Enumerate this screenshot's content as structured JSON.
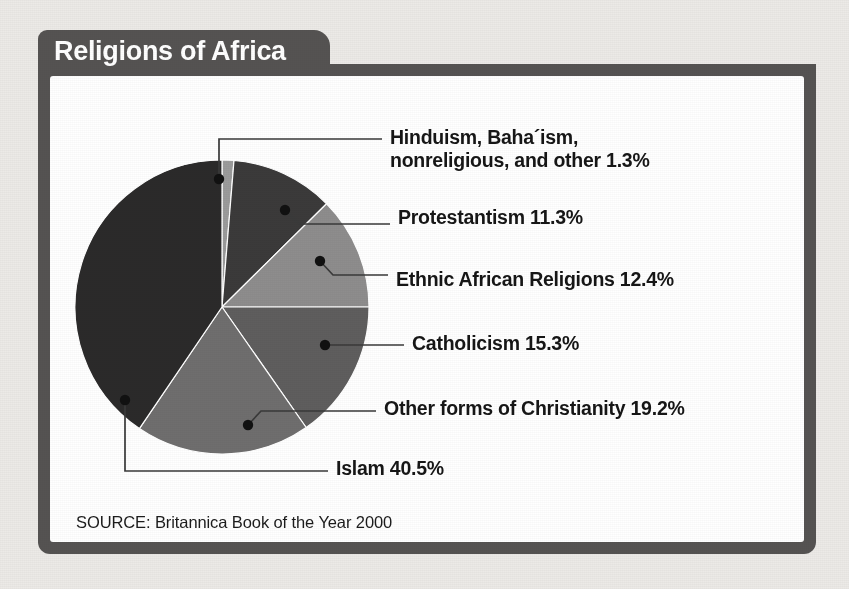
{
  "card": {
    "title": "Religions of Africa",
    "source": "SOURCE: Britannica Book of the Year 2000"
  },
  "colors": {
    "frame": "#555352",
    "title_text": "#ffffff",
    "card_background": "#ffffff",
    "page_background": "#eceae7",
    "label_text": "#161616",
    "leader_line": "#3a3a3a"
  },
  "chart_data": {
    "type": "pie",
    "title": "Religions of Africa",
    "subtitle": "",
    "xlabel": "",
    "ylabel": "",
    "source": "SOURCE: Britannica Book of the Year 2000",
    "units": "percent",
    "total": 100.0,
    "legend_position": "callout-labels-right",
    "grid": false,
    "start_angle_deg": 0,
    "direction": "clockwise",
    "categories": [
      "Hinduism, Baha´ism, nonreligious, and other",
      "Protestantism",
      "Ethnic African Religions",
      "Catholicism",
      "Other forms of Christianity",
      "Islam"
    ],
    "values": [
      1.3,
      11.3,
      12.4,
      15.3,
      19.2,
      40.5
    ],
    "slice_colors": [
      "#9b9b9b",
      "#3b3a3a",
      "#8e8d8d",
      "#5f5e5e",
      "#6f6e6e",
      "#2b2a2a"
    ],
    "slices": [
      {
        "label": "Hinduism, Baha´ism,\nnonreligious, and other 1.3%",
        "label_line1": "Hinduism, Baha´ism,",
        "label_line2": "nonreligious, and other 1.3%",
        "name": "Hinduism, Baha´ism, nonreligious, and other",
        "value": 1.3,
        "color": "#9b9b9b"
      },
      {
        "label": "Protestantism 11.3%",
        "name": "Protestantism",
        "value": 11.3,
        "color": "#3b3a3a"
      },
      {
        "label": "Ethnic African Religions 12.4%",
        "name": "Ethnic African Religions",
        "value": 12.4,
        "color": "#8e8d8d"
      },
      {
        "label": "Catholicism 15.3%",
        "name": "Catholicism",
        "value": 15.3,
        "color": "#5f5e5e"
      },
      {
        "label": "Other forms of Christianity 19.2%",
        "name": "Other forms of Christianity",
        "value": 19.2,
        "color": "#6f6e6e"
      },
      {
        "label": "Islam 40.5%",
        "name": "Islam",
        "value": 40.5,
        "color": "#2b2a2a"
      }
    ]
  }
}
